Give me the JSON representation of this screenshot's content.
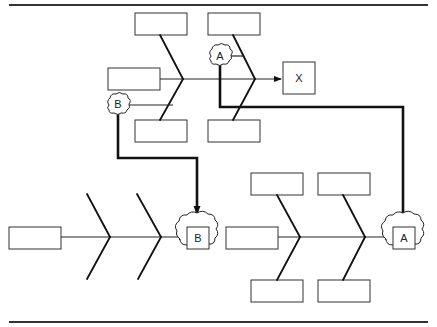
{
  "diagram": {
    "type": "linked fishbone diagrams",
    "top_fishbone": {
      "effect_label": "X",
      "cause_boxes": [
        "",
        "",
        "",
        "",
        ""
      ],
      "connectors": [
        "A",
        "B"
      ]
    },
    "bottom_left_fishbone": {
      "effect_label": "B",
      "cause_boxes": [
        ""
      ]
    },
    "bottom_right_fishbone": {
      "effect_label": "A",
      "cause_boxes": [
        "",
        "",
        "",
        "",
        ""
      ]
    },
    "labels": {
      "cloud_a_top": "A",
      "cloud_b_top": "B",
      "effect_x": "X",
      "effect_b": "B",
      "effect_a": "A"
    },
    "colors": {
      "line": "#111111",
      "background": "#ffffff"
    }
  }
}
